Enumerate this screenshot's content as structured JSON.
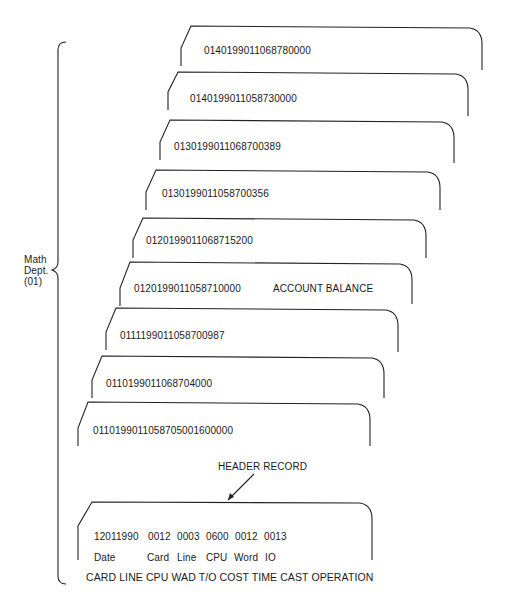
{
  "group_label": {
    "line1": "Math",
    "line2": "Dept.",
    "line3": "(01)"
  },
  "cards": [
    {
      "code": "0140199011068780000",
      "note": ""
    },
    {
      "code": "0140199011058730000",
      "note": ""
    },
    {
      "code": "0130199011068700389",
      "note": ""
    },
    {
      "code": "0130199011058700356",
      "note": ""
    },
    {
      "code": "0120199011068715200",
      "note": ""
    },
    {
      "code": "0120199011058710000",
      "note": "ACCOUNT BALANCE"
    },
    {
      "code": "0111199011058700987",
      "note": ""
    },
    {
      "code": "0110199011068704000",
      "note": ""
    },
    {
      "code": "0110199011058705001600000",
      "note": ""
    }
  ],
  "header_record": {
    "label": "HEADER RECORD",
    "values": [
      "12011990",
      "0012",
      "0003",
      "0600",
      "0012",
      "0013"
    ],
    "fields": [
      "Date",
      "Card",
      "Line",
      "CPU",
      "Word",
      "IO"
    ],
    "caption": "CARD LINE CPU WAD T/O COST TIME CAST OPERATION"
  }
}
